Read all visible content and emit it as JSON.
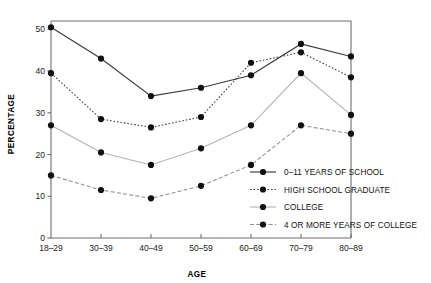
{
  "chart_data": {
    "type": "line",
    "title": "",
    "xlabel": "AGE",
    "ylabel": "PERCENTAGE",
    "categories": [
      "18–29",
      "30–39",
      "40–49",
      "50–59",
      "60–69",
      "70–79",
      "80–89"
    ],
    "ylim": [
      0,
      52
    ],
    "yticks": [
      0,
      10,
      20,
      30,
      40,
      50
    ],
    "ytick_labels": [
      "0",
      "10",
      "20",
      "30",
      "40",
      "50"
    ],
    "grid": false,
    "legend_position": "inside-lower-right",
    "series": [
      {
        "name": "0–11 YEARS OF SCHOOL",
        "style": "solid-dark",
        "color": "#3a3a3a",
        "values": [
          50.5,
          43,
          34,
          36,
          39,
          46.5,
          43.5
        ]
      },
      {
        "name": "HIGH SCHOOL GRADUATE",
        "style": "dotted",
        "color": "#3a3a3a",
        "values": [
          39.5,
          28.5,
          26.5,
          29,
          42,
          44.5,
          38.5
        ]
      },
      {
        "name": "COLLEGE",
        "style": "solid-light",
        "color": "#b4b4b4",
        "values": [
          27,
          20.5,
          17.5,
          21.5,
          27,
          39.5,
          29.5
        ]
      },
      {
        "name": "4 OR MORE YEARS OF COLLEGE",
        "style": "dash-dot",
        "color": "#8f8f8f",
        "values": [
          15,
          11.5,
          9.5,
          12.5,
          17.5,
          27,
          25
        ]
      }
    ]
  },
  "legend": {
    "items": [
      {
        "label": "0–11 YEARS OF SCHOOL"
      },
      {
        "label": "HIGH SCHOOL GRADUATE"
      },
      {
        "label": "COLLEGE"
      },
      {
        "label": "4 OR MORE YEARS OF COLLEGE"
      }
    ]
  }
}
